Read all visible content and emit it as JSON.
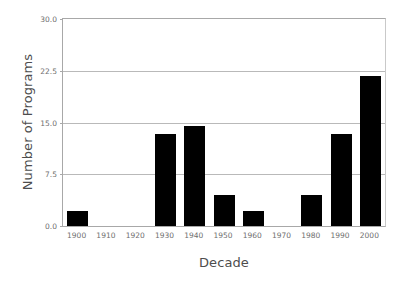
{
  "chart_data": {
    "type": "bar",
    "title": "",
    "xlabel": "Decade",
    "ylabel": "Number of Programs",
    "categories": [
      "1900",
      "1910",
      "1920",
      "1930",
      "1940",
      "1950",
      "1960",
      "1970",
      "1980",
      "1990",
      "2000"
    ],
    "values": [
      2.2,
      0,
      0,
      13.4,
      14.5,
      4.5,
      2.2,
      0,
      4.5,
      13.4,
      21.8
    ],
    "series": [
      {
        "name": "Number of Programs",
        "values": [
          2.2,
          0,
          0,
          13.4,
          14.5,
          4.5,
          2.2,
          0,
          4.5,
          13.4,
          21.8
        ]
      }
    ],
    "ylim": [
      0,
      30
    ],
    "xlim": [
      "1900",
      "2000"
    ],
    "y_ticks": [
      0.0,
      7.5,
      15.0,
      22.5,
      30.0
    ],
    "y_tick_labels": [
      "0.0",
      "7.5",
      "15.0",
      "22.5",
      "30.0"
    ],
    "grid": true,
    "grid_axis": "y",
    "legend": false,
    "legend_position": "none",
    "bar_color": "#000000",
    "grid_color": "#b9b9b9",
    "axis_color": "#a8a8a8",
    "background_color": "#ffffff",
    "text_color": "#4d4d4d",
    "tick_text_color": "#6e6e6e"
  },
  "axes": {
    "y_title": "Number of Programs",
    "x_title": "Decade"
  }
}
